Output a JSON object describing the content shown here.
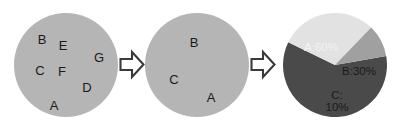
{
  "diagram": {
    "background_color": "#ffffff",
    "steps": [
      {
        "id": "full-set",
        "type": "circle-set",
        "fill_color": "#b5b5b5",
        "center": {
          "x": 66,
          "y": 65
        },
        "radius": 52,
        "items": [
          {
            "label": "B",
            "x": 42,
            "y": 39
          },
          {
            "label": "E",
            "x": 63,
            "y": 45
          },
          {
            "label": "G",
            "x": 99,
            "y": 57
          },
          {
            "label": "C",
            "x": 40,
            "y": 70
          },
          {
            "label": "F",
            "x": 62,
            "y": 71
          },
          {
            "label": "D",
            "x": 87,
            "y": 87
          },
          {
            "label": "A",
            "x": 54,
            "y": 105
          }
        ]
      },
      {
        "id": "reduced-set",
        "type": "circle-set",
        "fill_color": "#b5b5b5",
        "center": {
          "x": 197,
          "y": 65
        },
        "radius": 52,
        "items": [
          {
            "label": "B",
            "x": 194,
            "y": 42
          },
          {
            "label": "C",
            "x": 174,
            "y": 79
          },
          {
            "label": "A",
            "x": 211,
            "y": 97
          }
        ]
      },
      {
        "id": "pie-result",
        "type": "pie",
        "center": {
          "x": 335,
          "y": 65
        },
        "radius": 52
      }
    ],
    "arrows": [
      {
        "id": "arrow-1",
        "glyph": "right-block-arrow",
        "x": 119,
        "y": 49,
        "width": 26,
        "height": 31,
        "stroke_color": "#3a3a3a",
        "fill_color": "#ffffff"
      },
      {
        "id": "arrow-2",
        "glyph": "right-block-arrow",
        "x": 250,
        "y": 49,
        "width": 26,
        "height": 31,
        "stroke_color": "#3a3a3a",
        "fill_color": "#ffffff"
      }
    ]
  },
  "chart_data": {
    "type": "pie",
    "title": "",
    "categories": [
      "A",
      "B",
      "C"
    ],
    "values": [
      60,
      30,
      10
    ],
    "value_unit": "%",
    "labels": [
      "A:60%",
      "B:30%",
      "C:\n10%"
    ],
    "label_positions": [
      {
        "x": 321,
        "y": 47
      },
      {
        "x": 359,
        "y": 71
      },
      {
        "x": 337,
        "y": 101
      }
    ],
    "label_text_colors": [
      "#f2f2f2",
      "#1a1a1a",
      "#1a1a1a"
    ],
    "slice_colors": [
      "#4a4a4a",
      "#e2e2e2",
      "#a0a0a0"
    ],
    "start_angle_deg": -10,
    "direction": "clockwise",
    "legend": "none",
    "grid": false
  }
}
